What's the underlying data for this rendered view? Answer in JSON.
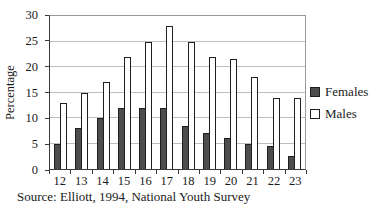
{
  "chart_data": {
    "type": "bar",
    "title": "",
    "xlabel": "",
    "ylabel": "Percentage",
    "categories": [
      "12",
      "13",
      "14",
      "15",
      "16",
      "17",
      "18",
      "19",
      "20",
      "21",
      "22",
      "23"
    ],
    "series": [
      {
        "name": "Females",
        "color": "#4d4d4d",
        "values": [
          5,
          8,
          10,
          12,
          12,
          12,
          8.5,
          7,
          6,
          5,
          4.5,
          2.5
        ]
      },
      {
        "name": "Males",
        "color": "#ffffff",
        "values": [
          13,
          15,
          17,
          22,
          25,
          28,
          25,
          22,
          21.5,
          18,
          14,
          14
        ]
      }
    ],
    "ylim": [
      0,
      30
    ],
    "yticks": [
      0,
      5,
      10,
      15,
      20,
      25,
      30
    ],
    "grid": true,
    "legend_position": "right",
    "source_note": "Source: Elliott, 1994, National Youth Survey"
  },
  "colors": {
    "bar_outline": "#1f1f1f",
    "gridline": "#bfbfbf",
    "frame": "#9a9a9a",
    "axis": "#3a3a3a",
    "text": "#1a1a1a",
    "background": "#ffffff"
  }
}
